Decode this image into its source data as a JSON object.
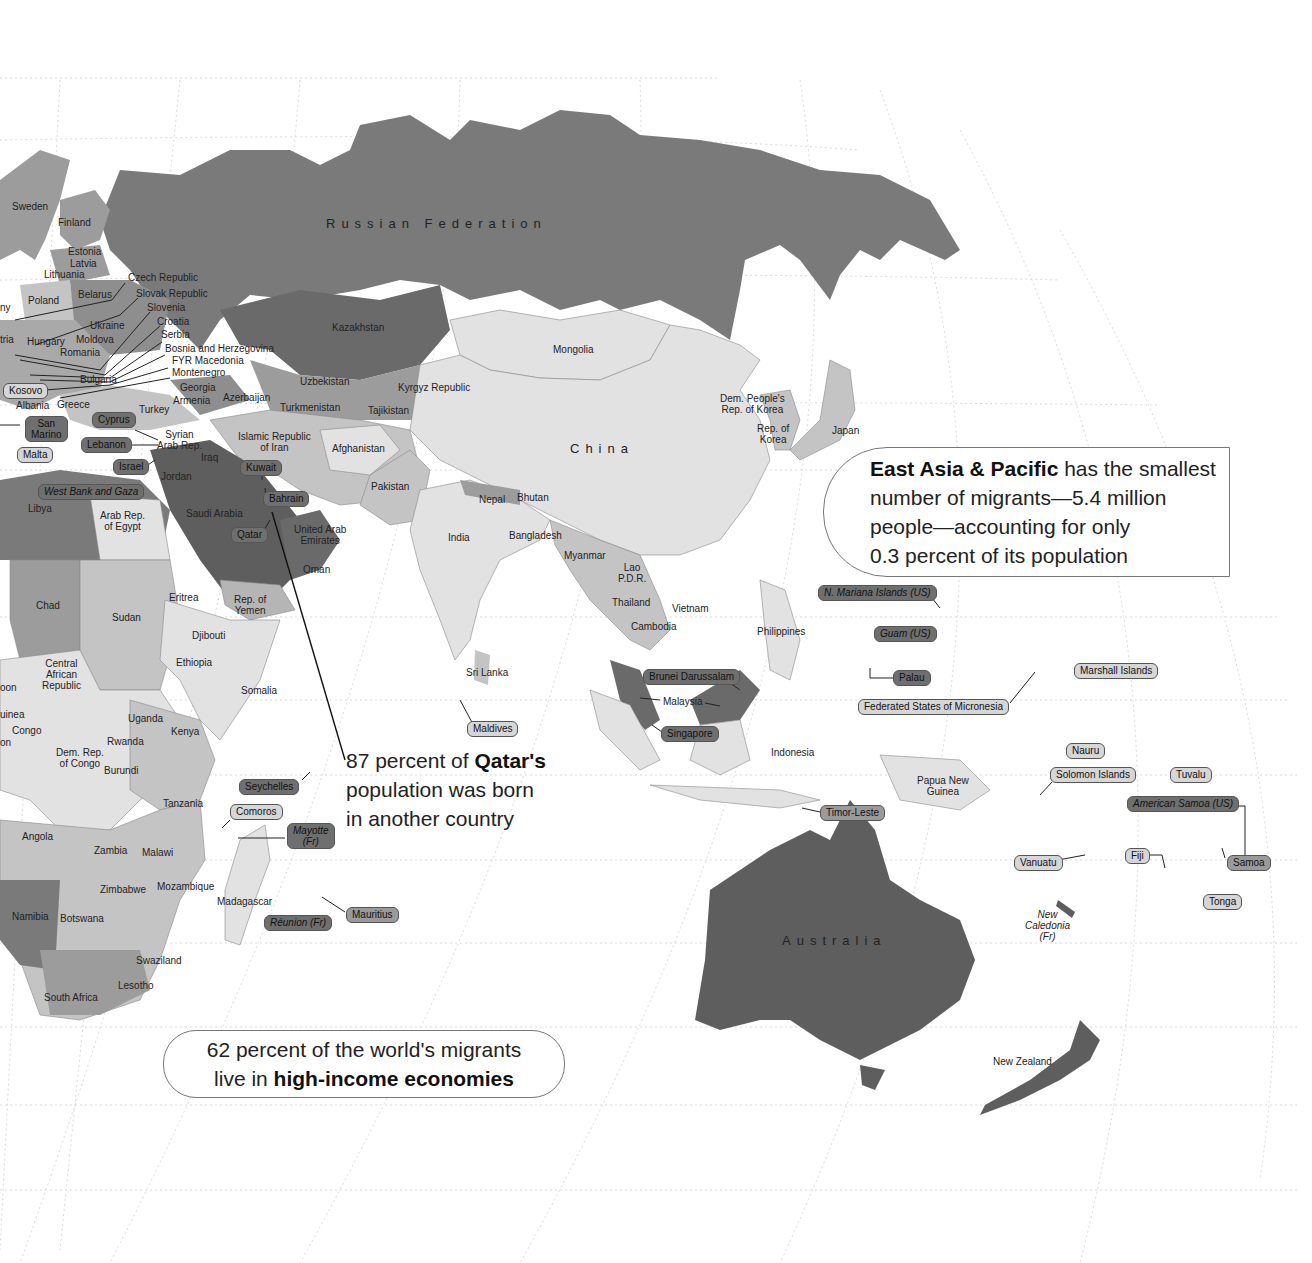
{
  "map": {
    "projection_style": "grayscale choropleth world map (Eastern Hemisphere crop)",
    "colors": {
      "ocean": "#ffffff",
      "graticule": "#d8d8d8",
      "shade_darkest": "#5e5e5e",
      "shade_dark": "#7a7a7a",
      "shade_mid": "#9c9c9c",
      "shade_light": "#c4c4c4",
      "shade_lightest": "#e2e2e2",
      "callout_line": "#111111"
    },
    "region_labels": {
      "russia": "Russian Federation",
      "china": "China",
      "australia": "Australia"
    },
    "country_labels": {
      "sweden": "Sweden",
      "finland": "Finland",
      "estonia": "Estonia",
      "latvia": "Latvia",
      "lithuania": "Lithuania",
      "poland": "Poland",
      "belarus": "Belarus",
      "czech": "Czech Republic",
      "slovak": "Slovak Republic",
      "slovenia": "Slovenia",
      "croatia": "Croatia",
      "serbia": "Serbia",
      "bosnia": "Bosnia and Herzegovina",
      "macedonia": "FYR Macedonia",
      "montenegro": "Montenegro",
      "ukraine": "Ukraine",
      "hungary": "Hungary",
      "moldova": "Moldova",
      "romania": "Romania",
      "bulgaria": "Bulgaria",
      "austria_partial": "tria",
      "germany_partial": "ny",
      "albania": "Albania",
      "greece": "Greece",
      "turkey": "Turkey",
      "georgia": "Georgia",
      "armenia": "Armenia",
      "azerbaijan": "Azerbaijan",
      "kazakhstan": "Kazakhstan",
      "uzbekistan": "Uzbekistan",
      "turkmenistan": "Turkmenistan",
      "kyrgyz": "Kyrgyz Republic",
      "tajikistan": "Tajikistan",
      "mongolia": "Mongolia",
      "syria": "Syrian\nArab Rep.",
      "iraq": "Iraq",
      "iran": "Islamic Republic\nof Iran",
      "afghanistan": "Afghanistan",
      "pakistan": "Pakistan",
      "jordan": "Jordan",
      "saudi": "Saudi Arabia",
      "uae": "United Arab\nEmirates",
      "oman": "Oman",
      "yemen": "Rep. of\nYemen",
      "libya": "Libya",
      "egypt": "Arab Rep.\nof Egypt",
      "chad": "Chad",
      "sudan": "Sudan",
      "eritrea": "Eritrea",
      "djibouti": "Djibouti",
      "ethiopia": "Ethiopia",
      "somalia": "Somalia",
      "car": "Central\nAfrican\nRepublic",
      "gabon_partial": "oon",
      "eq_guinea_partial": "uinea",
      "congo": "Congo",
      "cameroon_partial": "on",
      "uganda": "Uganda",
      "kenya": "Kenya",
      "rwanda": "Rwanda",
      "drc": "Dem. Rep.\nof Congo",
      "burundi": "Burundi",
      "tanzania": "Tanzania",
      "angola": "Angola",
      "zambia": "Zambia",
      "malawi": "Malawi",
      "zimbabwe": "Zimbabwe",
      "mozambique": "Mozambique",
      "madagascar": "Madagascar",
      "namibia": "Namibia",
      "botswana": "Botswana",
      "swaziland": "Swaziland",
      "lesotho": "Lesotho",
      "south_africa": "South Africa",
      "india": "India",
      "nepal": "Nepal",
      "bhutan": "Bhutan",
      "bangladesh": "Bangladesh",
      "sri_lanka": "Sri Lanka",
      "myanmar": "Myanmar",
      "lao": "Lao\nP.D.R.",
      "thailand": "Thailand",
      "vietnam": "Vietnam",
      "cambodia": "Cambodia",
      "malaysia": "Malaysia",
      "philippines": "Philippines",
      "indonesia": "Indonesia",
      "png": "Papua New\nGuinea",
      "dprk": "Dem. People's\nRep. of Korea",
      "korea": "Rep. of\nKorea",
      "japan": "Japan",
      "new_zealand": "New Zealand",
      "new_caledonia": "New\nCaledonia\n(Fr)"
    },
    "boxed_labels": {
      "kosovo": "Kosovo",
      "san_marino": "San\nMarino",
      "malta": "Malta",
      "cyprus": "Cyprus",
      "lebanon": "Lebanon",
      "israel": "Israel",
      "west_bank": "West Bank and Gaza",
      "kuwait": "Kuwait",
      "bahrain": "Bahrain",
      "qatar": "Qatar",
      "seychelles": "Seychelles",
      "comoros": "Comoros",
      "mayotte": "Mayotte\n(Fr)",
      "reunion": "Réunion (Fr)",
      "mauritius": "Mauritius",
      "maldives": "Maldives",
      "brunei": "Brunei Darussalam",
      "singapore": "Singapore",
      "timor": "Timor-Leste",
      "n_mariana": "N. Mariana Islands (US)",
      "guam": "Guam (US)",
      "palau": "Palau",
      "micronesia": "Federated States of Micronesia",
      "marshall": "Marshall Islands",
      "nauru": "Nauru",
      "solomon": "Solomon Islands",
      "tuvalu": "Tuvalu",
      "american_samoa": "American Samoa (US)",
      "vanuatu": "Vanuatu",
      "fiji": "Fiji",
      "samoa": "Samoa",
      "tonga": "Tonga"
    },
    "callouts": {
      "east_asia": {
        "bold": "East Asia & Pacific",
        "line1_rest": " has the smallest",
        "line2": "number of migrants—5.4 million",
        "line3": "people—accounting for only",
        "line4": "0.3 percent of its population"
      },
      "qatar": {
        "line1_pre": "87 percent of ",
        "bold": "Qatar's",
        "line2": "population was born",
        "line3": "in another country"
      },
      "high_income": {
        "line1": "62 percent of the world's migrants",
        "line2_pre": "live in ",
        "bold": "high-income economies"
      }
    }
  }
}
